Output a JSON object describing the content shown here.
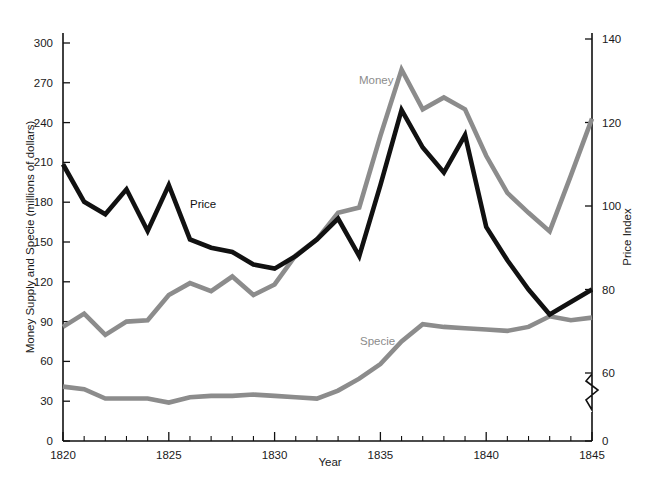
{
  "chart_data": {
    "type": "line",
    "title": "",
    "xlabel": "Year",
    "ylabel": "Money Supply and Specie (millions of dollars)",
    "y2label": "Price Index",
    "xlim": [
      1820,
      1845
    ],
    "ylim": [
      0,
      300
    ],
    "y2lim": [
      0,
      140
    ],
    "grid": false,
    "legend": "inline-labels",
    "y_ticks": [
      0,
      30,
      60,
      90,
      120,
      150,
      180,
      210,
      240,
      270,
      300
    ],
    "y2_ticks": [
      0,
      60,
      80,
      100,
      120,
      140
    ],
    "y2_axis_break": true,
    "x_ticks_major": [
      1820,
      1825,
      1830,
      1835,
      1840,
      1845
    ],
    "x_ticks_minor_every": 1,
    "x": [
      1820,
      1821,
      1822,
      1823,
      1824,
      1825,
      1826,
      1827,
      1828,
      1829,
      1830,
      1831,
      1832,
      1833,
      1834,
      1835,
      1836,
      1837,
      1838,
      1839,
      1840,
      1841,
      1842,
      1843,
      1844,
      1845
    ],
    "series": [
      {
        "name": "Money",
        "axis": "left",
        "color": "#8c8c8c",
        "label_text": "Money",
        "values": [
          86,
          96,
          80,
          90,
          91,
          110,
          119,
          113,
          124,
          110,
          118,
          140,
          152,
          172,
          176,
          230,
          280,
          250,
          259,
          250,
          215,
          187,
          172,
          158,
          200,
          243
        ]
      },
      {
        "name": "Specie",
        "axis": "left",
        "color": "#8c8c8c",
        "label_text": "Specie",
        "values": [
          41,
          39,
          32,
          32,
          32,
          29,
          33,
          34,
          34,
          35,
          34,
          33,
          32,
          38,
          47,
          58,
          75,
          88,
          86,
          85,
          84,
          83,
          86,
          94,
          91,
          93
        ]
      },
      {
        "name": "Price",
        "axis": "right",
        "color": "#111111",
        "label_text": "Price",
        "values": [
          110,
          101,
          98,
          104,
          94,
          105,
          92,
          90,
          89,
          86,
          85,
          88,
          92,
          97,
          88,
          105,
          123,
          114,
          108,
          117,
          95,
          87,
          80,
          74,
          77,
          80
        ]
      }
    ]
  },
  "labels": {
    "money": "Money",
    "specie": "Specie",
    "price": "Price",
    "x_axis_title": "Year",
    "y_left_title": "Money Supply and Specie (millions of dollars)",
    "y_right_title": "Price Index",
    "y_left_ticks": [
      "0",
      "30",
      "60",
      "90",
      "120",
      "150",
      "180",
      "210",
      "240",
      "270",
      "300"
    ],
    "y_right_ticks": [
      "0",
      "60",
      "80",
      "100",
      "120",
      "140"
    ],
    "x_tick_labels": [
      "1820",
      "1825",
      "1830",
      "1835",
      "1840",
      "1845"
    ]
  },
  "colors": {
    "line_gray": "#8c8c8c",
    "line_black": "#111111",
    "axis": "#111111",
    "background": "#ffffff"
  }
}
